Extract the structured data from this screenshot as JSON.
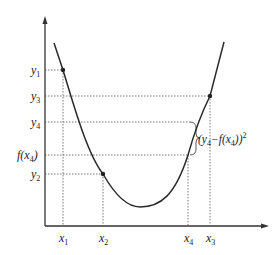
{
  "diagram": {
    "type": "function-curve-with-squared-error",
    "y_axis_labels": [
      {
        "id": "y1",
        "base": "y",
        "sub": "1"
      },
      {
        "id": "y3",
        "base": "y",
        "sub": "3"
      },
      {
        "id": "y4",
        "base": "y",
        "sub": "4"
      },
      {
        "id": "fx4",
        "text": "f(x",
        "sub": "4",
        "close": ")"
      },
      {
        "id": "y2",
        "base": "y",
        "sub": "2"
      }
    ],
    "x_axis_labels": [
      {
        "id": "x1",
        "base": "x",
        "sub": "1"
      },
      {
        "id": "x2",
        "base": "x",
        "sub": "2"
      },
      {
        "id": "x4",
        "base": "x",
        "sub": "4"
      },
      {
        "id": "x3",
        "base": "x",
        "sub": "3"
      }
    ],
    "annotation": {
      "open": "(y",
      "sub1": "4",
      "mid": "−f(x",
      "sub2": "4",
      "close": "))",
      "sup": "2"
    },
    "colors": {
      "curve": "#2a2a2a",
      "axis": "#333333",
      "guide": "#555555"
    }
  }
}
